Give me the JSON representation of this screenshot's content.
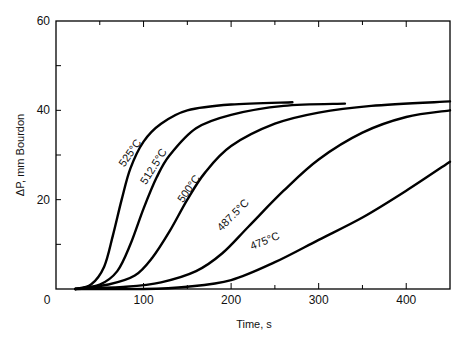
{
  "chart_data": {
    "type": "line",
    "title": "",
    "xlabel": "Time, s",
    "ylabel": "ΔP, mm Bourdon",
    "xlim": [
      0,
      450
    ],
    "ylim": [
      0,
      60
    ],
    "x_ticks": [
      0,
      100,
      200,
      300,
      400
    ],
    "x_minor_ticks": [
      50,
      150,
      250,
      350
    ],
    "y_ticks": [
      0,
      20,
      40,
      60
    ],
    "y_minor_ticks": [
      10,
      30,
      50
    ],
    "grid": false,
    "legend": "inline labels on curves",
    "series": [
      {
        "name": "525°C",
        "x": [
          22,
          40,
          55,
          65,
          75,
          85,
          100,
          120,
          150,
          200,
          270
        ],
        "y": [
          0,
          1,
          5,
          12,
          20,
          27,
          33,
          37,
          40,
          41.3,
          41.8
        ]
      },
      {
        "name": "512.5°C",
        "x": [
          22,
          50,
          70,
          85,
          100,
          115,
          130,
          160,
          200,
          260,
          330
        ],
        "y": [
          0,
          1,
          4,
          10,
          18,
          25,
          30,
          36,
          39,
          41,
          41.5
        ]
      },
      {
        "name": "500°C",
        "x": [
          22,
          60,
          90,
          110,
          130,
          150,
          170,
          200,
          250,
          300,
          360,
          450
        ],
        "y": [
          0,
          1,
          3,
          7,
          13,
          20,
          26,
          32,
          37,
          39.5,
          41,
          42
        ]
      },
      {
        "name": "487.5°C",
        "x": [
          22,
          80,
          120,
          160,
          190,
          220,
          260,
          300,
          350,
          400,
          450
        ],
        "y": [
          0,
          0.5,
          1.5,
          4,
          8,
          14,
          22,
          29,
          35,
          38.5,
          40
        ]
      },
      {
        "name": "475°C",
        "x": [
          22,
          100,
          150,
          200,
          250,
          300,
          350,
          400,
          450
        ],
        "y": [
          0,
          0,
          0.5,
          2,
          6,
          11,
          16,
          22,
          28.5
        ]
      }
    ],
    "annotations": [
      {
        "text": "525°C",
        "x": 88,
        "y": 30,
        "angle": -55
      },
      {
        "text": "512.5°C",
        "x": 115,
        "y": 27,
        "angle": -58
      },
      {
        "text": "500°C",
        "x": 155,
        "y": 22,
        "angle": -55
      },
      {
        "text": "487.5°C",
        "x": 205,
        "y": 16,
        "angle": -45
      },
      {
        "text": "475°C",
        "x": 240,
        "y": 10,
        "angle": -22
      }
    ]
  },
  "axes": {
    "x_title": "Time, s",
    "y_title": "ΔP, mm Bourdon",
    "x_tick_labels": [
      "0",
      "100",
      "200",
      "300",
      "400"
    ],
    "y_tick_labels": [
      "0",
      "20",
      "40",
      "60"
    ]
  }
}
